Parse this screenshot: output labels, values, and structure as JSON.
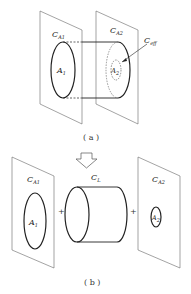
{
  "panel_a": {
    "plate_left_label": "C",
    "plate_left_sub": "A1",
    "plate_right_label": "C",
    "plate_right_sub": "A2",
    "effective_label": "C",
    "effective_sub": "eff",
    "area1_label": "A",
    "area1_sub": "1",
    "area2_label": "A",
    "area2_sub": "2",
    "caption": "( a )"
  },
  "arrow": {
    "icon": "down-arrow-icon"
  },
  "panel_b": {
    "plate_left_label": "C",
    "plate_left_sub": "A1",
    "cylinder_label": "C",
    "cylinder_sub": "L",
    "plate_right_label": "C",
    "plate_right_sub": "A2",
    "area1_label": "A",
    "area1_sub": "1",
    "area2_label": "A",
    "area2_sub": "2",
    "plus1": "+",
    "plus2": "+",
    "caption": "( b )"
  }
}
